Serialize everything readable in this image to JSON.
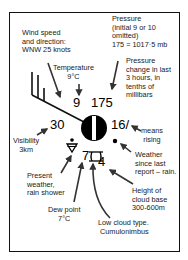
{
  "diagram": {
    "labels": {
      "wind": [
        "Wind speed",
        "and direction:",
        "WNW 25 knots"
      ],
      "temperature": [
        "Temperature",
        "9°C"
      ],
      "pressure": [
        "Pressure",
        "(initial 9 or 10",
        "omitted)",
        "175 = 1017·5 mb"
      ],
      "pressure_change": [
        "Pressure",
        "change in last",
        "3 hours, in",
        "tenths of",
        "millibars"
      ],
      "visibility": [
        "Visibility",
        "3km"
      ],
      "means_rising": [
        "means",
        "rising"
      ],
      "weather_since": [
        "Weather",
        "since last",
        "report – rain."
      ],
      "present_weather": [
        "Present",
        "weather,",
        "rain shower"
      ],
      "cloud_base": [
        "Height of",
        "cloud base",
        "300-600m"
      ],
      "dew_point": [
        "Dew point",
        "7°C"
      ],
      "low_cloud": [
        "Low cloud type.",
        "Cumulonimbus"
      ]
    },
    "values": {
      "temperature": "9",
      "pressure": "175",
      "visibility": "30",
      "pressure_change": "16",
      "tendency_symbol": "/",
      "dew_point": "7",
      "cloud_base_code": "4"
    },
    "colors": {
      "ink": "#111111",
      "background": "#ffffff"
    }
  }
}
